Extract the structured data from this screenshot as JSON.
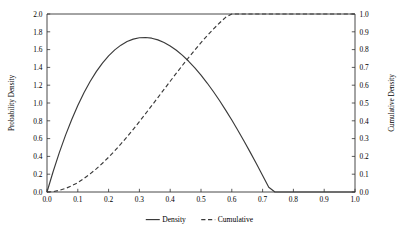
{
  "chart_data": {
    "type": "line",
    "title": "",
    "xlabel": "",
    "ylabel": "Probability Density",
    "y2label": "Cumulative Density",
    "xlim": [
      0.0,
      1.0
    ],
    "ylim": [
      0.0,
      2.0
    ],
    "y2lim": [
      0.0,
      1.0
    ],
    "grid": false,
    "legend_position": "bottom-center",
    "xticks": [
      "0.0",
      "0.1",
      "0.2",
      "0.3",
      "0.4",
      "0.5",
      "0.6",
      "0.7",
      "0.8",
      "0.9",
      "1.0"
    ],
    "xtick_values": [
      0.0,
      0.1,
      0.2,
      0.3,
      0.4,
      0.5,
      0.6,
      0.7,
      0.8,
      0.9,
      1.0
    ],
    "yticks": [
      "0.0",
      "0.2",
      "0.4",
      "0.6",
      "0.8",
      "1.0",
      "1.2",
      "1.4",
      "1.6",
      "1.8",
      "2.0"
    ],
    "ytick_values": [
      0.0,
      0.2,
      0.4,
      0.6,
      0.8,
      1.0,
      1.2,
      1.4,
      1.6,
      1.8,
      2.0
    ],
    "y2ticks": [
      "0.0",
      "0.1",
      "0.2",
      "0.3",
      "0.4",
      "0.5",
      "0.6",
      "0.7",
      "0.8",
      "0.9",
      "1.0"
    ],
    "y2tick_values": [
      0.0,
      0.1,
      0.2,
      0.3,
      0.4,
      0.5,
      0.6,
      0.7,
      0.8,
      0.9,
      1.0
    ],
    "x": [
      0.0,
      0.02,
      0.04,
      0.06,
      0.08,
      0.1,
      0.12,
      0.14,
      0.16,
      0.18,
      0.2,
      0.22,
      0.24,
      0.26,
      0.28,
      0.3,
      0.32,
      0.34,
      0.36,
      0.38,
      0.4,
      0.42,
      0.44,
      0.46,
      0.48,
      0.5,
      0.52,
      0.54,
      0.56,
      0.58,
      0.6,
      0.62,
      0.64,
      0.66,
      0.68,
      0.7,
      0.72,
      0.74,
      0.76,
      0.78,
      0.8,
      0.82,
      0.84,
      0.86,
      0.88,
      0.9,
      0.92,
      0.94,
      0.96,
      0.98,
      1.0
    ],
    "series": [
      {
        "name": "Density",
        "axis": "left",
        "style": "solid",
        "values": [
          0.0,
          0.2305,
          0.4424,
          0.6363,
          0.8127,
          0.972,
          1.1147,
          1.2414,
          1.3524,
          1.4483,
          1.5296,
          1.5967,
          1.6501,
          1.6903,
          1.7177,
          1.7328,
          1.7362,
          1.7282,
          1.7093,
          1.6801,
          1.6409,
          1.5923,
          1.5348,
          1.4688,
          1.3947,
          1.3131,
          1.2244,
          1.1291,
          1.0276,
          0.9205,
          0.8083,
          0.6913,
          0.5702,
          0.4453,
          0.3172,
          0.1863,
          0.0532,
          0.0,
          0.0,
          0.0,
          0.0,
          0.0,
          0.0,
          0.0,
          0.0,
          0.0,
          0.0,
          0.0,
          0.0,
          0.0,
          0.0
        ],
        "values_note": "Beta(2,3) pdf = 12x(1-x)^2"
      },
      {
        "name": "Cumulative",
        "axis": "right",
        "style": "dashed",
        "values": [
          0.0,
          0.0023,
          0.009,
          0.0199,
          0.0348,
          0.0523,
          0.0762,
          0.1017,
          0.1302,
          0.1614,
          0.1953,
          0.2315,
          0.2699,
          0.3102,
          0.3521,
          0.3954,
          0.4398,
          0.4849,
          0.5306,
          0.5764,
          0.6221,
          0.6675,
          0.7121,
          0.7557,
          0.7981,
          0.8389,
          0.8779,
          0.9148,
          0.9493,
          0.9813,
          1.0,
          1.0,
          1.0,
          1.0,
          1.0,
          1.0,
          1.0,
          1.0,
          1.0,
          1.0,
          1.0,
          1.0,
          1.0,
          1.0,
          1.0,
          1.0,
          1.0,
          1.0,
          1.0,
          1.0,
          1.0
        ],
        "values_note": "Beta(2,3) cdf"
      }
    ],
    "annotations": {
      "density_peak_x": 0.333,
      "density_peak_y": 1.78,
      "curve_crossing_x": 0.51,
      "curve_crossing_density": 1.45,
      "curve_crossing_cumulative": 0.72
    }
  },
  "legend": {
    "items": [
      {
        "label": "Density",
        "style": "solid"
      },
      {
        "label": "Cumulative",
        "style": "dashed"
      }
    ]
  },
  "colors": {
    "line": "#3a3a3a",
    "axis": "#333333",
    "background": "#ffffff"
  }
}
